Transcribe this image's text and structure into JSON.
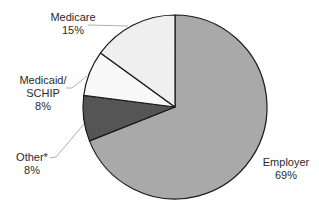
{
  "chart_data": {
    "type": "pie",
    "title": "",
    "start_angle_deg": 0,
    "direction": "clockwise",
    "slices": [
      {
        "label": "Employer",
        "value": 69,
        "value_label": "69%",
        "color": "#a9a9a9"
      },
      {
        "label": "Other*",
        "value": 8,
        "value_label": "8%",
        "color": "#555555"
      },
      {
        "label": "Medicaid/ SCHIP",
        "value": 8,
        "value_label": "8%",
        "color": "#f8f8f8"
      },
      {
        "label": "Medicare",
        "value": 15,
        "value_label": "15%",
        "color": "#efefef"
      }
    ],
    "legend": "none",
    "labels_outside_with_leader_lines": true
  },
  "labels": {
    "medicare": {
      "name": "Medicare",
      "pct": "15%"
    },
    "medicaid": {
      "line1": "Medicaid/",
      "line2": "SCHIP",
      "pct": "8%"
    },
    "other": {
      "name": "Other*",
      "pct": "8%"
    },
    "employer": {
      "name": "Employer",
      "pct": "69%"
    }
  }
}
